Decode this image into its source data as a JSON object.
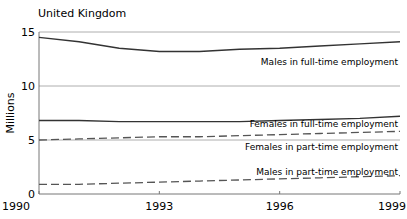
{
  "chart_data": {
    "type": "line",
    "title": "United Kingdom",
    "xlabel": "",
    "ylabel": "Millions",
    "xlim": [
      1990,
      1999
    ],
    "ylim": [
      0,
      15
    ],
    "grid": "horizontal at 5, 10, 15",
    "legend": "inline labels",
    "x": [
      1990,
      1991,
      1992,
      1993,
      1994,
      1995,
      1996,
      1997,
      1998,
      1999
    ],
    "x_tick_labels": [
      "1990",
      "1993",
      "1996",
      "1999"
    ],
    "y_tick_labels": [
      "0",
      "5",
      "10",
      "15"
    ],
    "series": [
      {
        "name": "Males in full-time employment",
        "style": "solid",
        "values": [
          14.5,
          14.1,
          13.5,
          13.2,
          13.2,
          13.4,
          13.5,
          13.7,
          13.9,
          14.1
        ]
      },
      {
        "name": "Females in full-time employment",
        "style": "solid",
        "values": [
          6.8,
          6.8,
          6.7,
          6.7,
          6.7,
          6.7,
          6.8,
          6.9,
          7.0,
          7.2
        ]
      },
      {
        "name": "Females in part-time employment",
        "style": "dashed",
        "values": [
          5.0,
          5.1,
          5.2,
          5.3,
          5.3,
          5.4,
          5.5,
          5.6,
          5.7,
          5.8
        ]
      },
      {
        "name": "Males in part-time employment",
        "style": "dashed",
        "values": [
          0.9,
          0.9,
          1.0,
          1.1,
          1.2,
          1.3,
          1.4,
          1.5,
          1.6,
          1.7
        ]
      }
    ]
  }
}
